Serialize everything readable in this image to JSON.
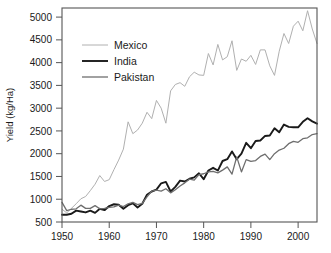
{
  "chart_data": {
    "type": "line",
    "title": "",
    "xlabel": "",
    "ylabel": "Yield (kg/Ha)",
    "xlim": [
      1950,
      2004
    ],
    "ylim": [
      500,
      5200
    ],
    "grid": false,
    "legend_position": "upper-left-inside",
    "xticks": [
      1950,
      1960,
      1970,
      1980,
      1990,
      2000
    ],
    "xtick_labels": [
      "1950",
      "1960",
      "1970",
      "1980",
      "1990",
      "2000"
    ],
    "yticks": [
      500,
      1000,
      1500,
      2000,
      2500,
      3000,
      3500,
      4000,
      4500,
      5000
    ],
    "ytick_labels": [
      "500",
      "1000",
      "1500",
      "2000",
      "2500",
      "3000",
      "3500",
      "4000",
      "4500",
      "5000"
    ],
    "x": [
      1950,
      1951,
      1952,
      1953,
      1954,
      1955,
      1956,
      1957,
      1958,
      1959,
      1960,
      1961,
      1962,
      1963,
      1964,
      1965,
      1966,
      1967,
      1968,
      1969,
      1970,
      1971,
      1972,
      1973,
      1974,
      1975,
      1976,
      1977,
      1978,
      1979,
      1980,
      1981,
      1982,
      1983,
      1984,
      1985,
      1986,
      1987,
      1988,
      1989,
      1990,
      1991,
      1992,
      1993,
      1994,
      1995,
      1996,
      1997,
      1998,
      1999,
      2000,
      2001,
      2002,
      2003,
      2004
    ],
    "series": [
      {
        "name": "Mexico",
        "color": "#b0b0b0",
        "line_width": 1.0,
        "values": [
          780,
          700,
          800,
          900,
          1010,
          1060,
          1190,
          1330,
          1520,
          1390,
          1430,
          1650,
          1860,
          2100,
          2700,
          2440,
          2520,
          2670,
          2910,
          2770,
          3170,
          3000,
          2670,
          3380,
          3520,
          3560,
          3480,
          3690,
          3790,
          3730,
          3720,
          4200,
          3950,
          4400,
          4060,
          4130,
          4480,
          3830,
          4080,
          4030,
          4160,
          3960,
          4280,
          4280,
          3930,
          3720,
          4250,
          4640,
          4420,
          4800,
          4910,
          4700,
          5140,
          4740,
          4420
        ]
      },
      {
        "name": "India",
        "color": "#1a1a1a",
        "line_width": 1.9,
        "values": [
          660,
          660,
          680,
          750,
          730,
          710,
          750,
          700,
          790,
          760,
          850,
          890,
          880,
          790,
          870,
          910,
          820,
          900,
          1100,
          1170,
          1210,
          1350,
          1380,
          1170,
          1270,
          1410,
          1390,
          1450,
          1480,
          1570,
          1440,
          1630,
          1690,
          1630,
          1840,
          1880,
          2050,
          1880,
          2000,
          2240,
          2120,
          2280,
          2290,
          2390,
          2400,
          2560,
          2470,
          2640,
          2590,
          2580,
          2580,
          2700,
          2780,
          2710,
          2660
        ]
      },
      {
        "name": "Pakistan",
        "color": "#6e6e6e",
        "line_width": 1.3,
        "values": [
          930,
          750,
          780,
          790,
          870,
          800,
          800,
          860,
          790,
          800,
          820,
          830,
          870,
          840,
          900,
          930,
          880,
          910,
          1050,
          1180,
          1200,
          1180,
          1230,
          1140,
          1210,
          1290,
          1360,
          1440,
          1420,
          1540,
          1560,
          1600,
          1610,
          1580,
          1640,
          1710,
          1550,
          1930,
          1600,
          1870,
          1830,
          1850,
          1940,
          1990,
          1870,
          2000,
          2080,
          2120,
          2220,
          2270,
          2250,
          2330,
          2350,
          2420,
          2440
        ]
      }
    ]
  },
  "legend": {
    "entries": [
      {
        "label": "Mexico"
      },
      {
        "label": "India"
      },
      {
        "label": "Pakistan"
      }
    ]
  },
  "axes": {
    "y_title": "Yield (kg/Ha)"
  }
}
